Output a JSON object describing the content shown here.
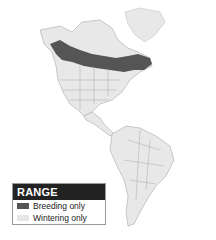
{
  "legend": {
    "title": "RANGE",
    "items": [
      {
        "label": "Breeding only",
        "color": "#555555"
      },
      {
        "label": "Wintering only",
        "color": "#e6e6e6"
      }
    ]
  },
  "map": {
    "land_color": "#e8e8e8",
    "border_color": "#9a9a9a",
    "breeding_color": "#555555"
  }
}
